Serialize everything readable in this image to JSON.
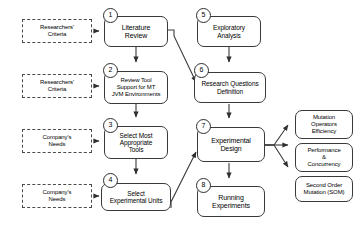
{
  "diagram": {
    "type": "flowchart",
    "background_color": "#ffffff",
    "line_color": "#3a3a3a",
    "inputs": [
      {
        "id": "in1",
        "label": "Researchers'\nCriteria",
        "line1": "Researchers'",
        "line2": "Criteria"
      },
      {
        "id": "in2",
        "label": "Researchers'\nCriteria",
        "line1": "Researchers'",
        "line2": "Criteria"
      },
      {
        "id": "in3",
        "label": "Company's\nNeeds",
        "line1": "Company's",
        "line2": "Needs"
      },
      {
        "id": "in4",
        "label": "Company's\nNeeds",
        "line1": "Company's",
        "line2": "Needs"
      }
    ],
    "steps": [
      {
        "number": "1",
        "line1": "Literature",
        "line2": "Review",
        "line3": ""
      },
      {
        "number": "2",
        "line1": "Review Tool",
        "line2": "Support for MT",
        "line3": "JVM Environments"
      },
      {
        "number": "3",
        "line1": "Select Most",
        "line2": "Appropriate",
        "line3": "Tools"
      },
      {
        "number": "4",
        "line1": "Select",
        "line2": "Experimental Units",
        "line3": ""
      },
      {
        "number": "5",
        "line1": "Exploratory",
        "line2": "Analysis",
        "line3": ""
      },
      {
        "number": "6",
        "line1": "Research Questions",
        "line2": "Definition",
        "line3": ""
      },
      {
        "number": "7",
        "line1": "Experimental",
        "line2": "Design",
        "line3": ""
      },
      {
        "number": "8",
        "line1": "Running",
        "line2": "Experiments",
        "line3": ""
      }
    ],
    "outcomes": [
      {
        "id": "out1",
        "line1": "Mutation",
        "line2": "Operators",
        "line3": "Efficiency"
      },
      {
        "id": "out2",
        "line1": "Performance",
        "line2": "&",
        "line3": "Concurrency"
      },
      {
        "id": "out3",
        "line1": "Second Order",
        "line2": "Mutation (SOM)",
        "line3": ""
      }
    ]
  }
}
